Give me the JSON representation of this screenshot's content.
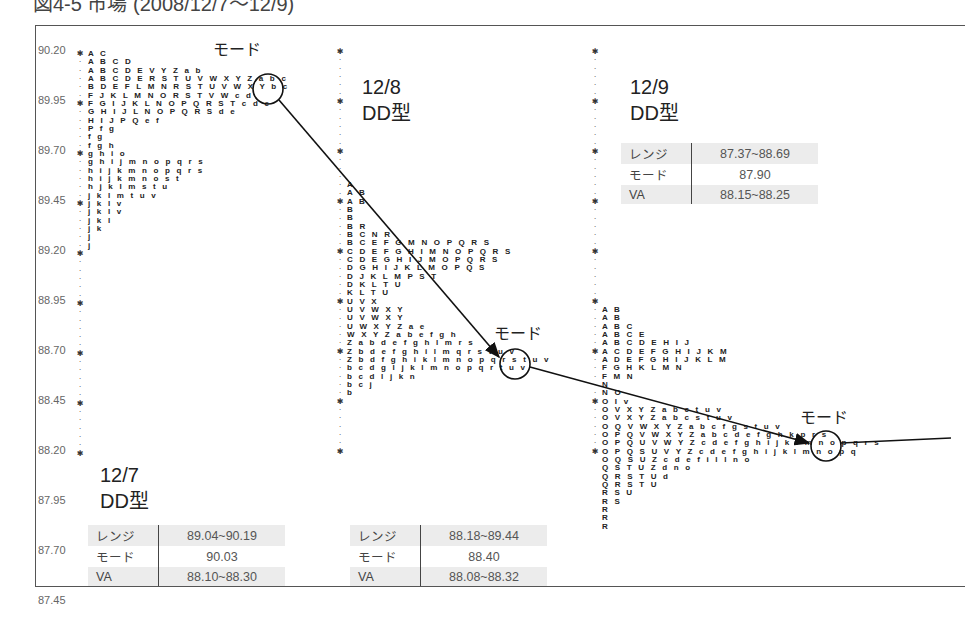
{
  "title": "図4-5 市場 (2008/12/7〜12/9)",
  "chart_data": {
    "type": "market-profile",
    "title": "図4-5 市場 (2008/12/7〜12/9)",
    "ylabel": "Price",
    "y_ticks": [
      "90.20",
      "89.95",
      "89.70",
      "89.45",
      "89.20",
      "88.95",
      "88.70",
      "88.45",
      "88.20",
      "87.95",
      "87.70",
      "87.45"
    ],
    "ylim": [
      87.45,
      90.2
    ],
    "days": [
      {
        "date": "12/7",
        "type": "DD型",
        "range": "89.04~90.19",
        "mode": "90.03",
        "va": "88.10~88.30",
        "profile": [
          "A C",
          "A B C D",
          "A B C D E V Y Z a b",
          "A B C D E R S T U V W X Y Z a b c",
          "B D E F L M N R S T U V W X Y b c",
          "F J K L M N O R S T V W c d",
          "F G I J K L N O P Q R S T c d e",
          "G H I J L N O P Q R S d e",
          "H I J P Q e f",
          "P f g",
          "f g",
          "f g h",
          "g h i o",
          "g h i j m n o p q r s",
          "h i j k m n o p q r s",
          "h i j k m n o s t",
          "h j k l m s t u",
          "j k l m t u v",
          "j k l v",
          "j k l v",
          "j k l",
          "j k",
          "j",
          "j"
        ]
      },
      {
        "date": "12/8",
        "type": "DD型",
        "range": "88.18~89.44",
        "mode": "88.40",
        "va": "88.08~88.32",
        "profile": [
          "A",
          "A B",
          "A B",
          "B",
          "B",
          "B R",
          "B C N R",
          "B C E F G M N O P Q R S",
          "C D E F G H I M N O P Q R S",
          "C D E G H I J M O P Q R S",
          "D G H I J K L M O P Q S",
          "D J K L M P S T",
          "D K L T U",
          "K L T U",
          "U V X",
          "U V W X Y",
          "U V W X Y",
          "U W X Y Z a e",
          "W X Y Z a b e f g h",
          "Z a b d e f g h l m r s",
          "Z b d e f g h i l m q r s t u v",
          "Z b d f g h i k l m n o p q r s t u v",
          "b c d g l j k l m n o p q r t u v",
          "b c d l j k n",
          "b c j",
          "b"
        ]
      },
      {
        "date": "12/9",
        "type": "DD型",
        "range": "87.37~88.69",
        "mode": "87.90",
        "va": "88.15~88.25",
        "profile": [
          "A B",
          "A B",
          "A B C",
          "A B C E",
          "A B C D E H I J",
          "A C D E F G H I J K M",
          "A D E F G H I J K L M",
          "F G H K L M N",
          "F M N",
          "N",
          "N O",
          "O I v",
          "O V X Y Z a b c t u v",
          "O V X Y Z a b c s t u v",
          "O Q V W X Y Z a b c f g s t u v",
          "O P Q V W X Y Z a b c d e f g h k p r s",
          "O P Q U V W Y Z c d e f g h i j k l m n o p q r s",
          "O P Q S U V Y Z c d e f g h i j k l m n o p q",
          "O Q S U Z c d e f i l l n o",
          "Q S T U Z d n o",
          "Q R S T U d",
          "Q R S T U",
          "R S U",
          "R S",
          "R",
          "R",
          "R"
        ]
      }
    ],
    "annotations": [
      "モード",
      "モード",
      "モード"
    ]
  },
  "labels": {
    "mode": "モード",
    "range_key": "レンジ",
    "mode_key": "モード",
    "va_key": "VA",
    "mode_circle_1": "b c",
    "mode_circle_2": "u v",
    "mode_circle_3": "r s"
  }
}
